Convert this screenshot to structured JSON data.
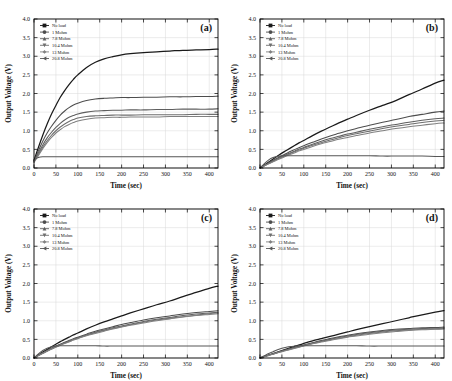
{
  "figure": {
    "background": "#ffffff",
    "panel_count": 4
  },
  "axes": {
    "xlabel": "Time (sec)",
    "ylabel": "Output Voltage (V)",
    "xlim": [
      0,
      420
    ],
    "ylim": [
      0.0,
      4.0
    ],
    "xticks": [
      0,
      50,
      100,
      150,
      200,
      250,
      300,
      350,
      400
    ],
    "xtick_labels": [
      "0",
      "50",
      "100",
      "150",
      "200",
      "250",
      "300",
      "350",
      "400"
    ],
    "yticks": [
      0.0,
      0.5,
      1.0,
      1.5,
      2.0,
      2.5,
      3.0,
      3.5,
      4.0
    ],
    "ytick_labels": [
      "0.0",
      "0.5",
      "1.0",
      "1.5",
      "2.0",
      "2.5",
      "3.0",
      "3.5",
      "4.0"
    ],
    "grid": true
  },
  "series_meta": [
    {
      "label": "No load",
      "marker": "square",
      "color": "#1a1a1a"
    },
    {
      "label": "1 Mohm",
      "marker": "circle",
      "color": "#4d4d4d"
    },
    {
      "label": "7.8 Mohm",
      "marker": "triangle-up",
      "color": "#5e5e5e"
    },
    {
      "label": "10.4 Mohm",
      "marker": "triangle-down",
      "color": "#6e6e6e"
    },
    {
      "label": "13 Mohm",
      "marker": "diamond",
      "color": "#808080"
    },
    {
      "label": "20.8 Mohm",
      "marker": "triangle-left",
      "color": "#565656"
    }
  ],
  "chart_data": [
    {
      "type": "line",
      "panel": "(a)",
      "title": "",
      "xlabel": "Time (sec)",
      "ylabel": "Output Voltage (V)",
      "xlim": [
        0,
        420
      ],
      "ylim": [
        0.0,
        4.0
      ],
      "grid": true,
      "legend_position": "upper-left",
      "x": [
        0,
        10,
        20,
        30,
        40,
        50,
        60,
        70,
        80,
        90,
        100,
        120,
        140,
        160,
        180,
        200,
        220,
        250,
        280,
        310,
        340,
        370,
        400,
        420
      ],
      "series": [
        {
          "name": "No load",
          "values": [
            0.2,
            0.55,
            0.88,
            1.18,
            1.45,
            1.68,
            1.9,
            2.08,
            2.24,
            2.38,
            2.5,
            2.7,
            2.84,
            2.93,
            2.99,
            3.04,
            3.07,
            3.1,
            3.12,
            3.14,
            3.16,
            3.17,
            3.18,
            3.19
          ]
        },
        {
          "name": "1 Mohm",
          "values": [
            0.18,
            0.46,
            0.72,
            0.94,
            1.12,
            1.28,
            1.42,
            1.53,
            1.62,
            1.69,
            1.74,
            1.81,
            1.85,
            1.87,
            1.88,
            1.89,
            1.89,
            1.9,
            1.9,
            1.91,
            1.91,
            1.92,
            1.92,
            1.93
          ]
        },
        {
          "name": "7.8 Mohm",
          "values": [
            0.17,
            0.4,
            0.62,
            0.81,
            0.96,
            1.09,
            1.2,
            1.29,
            1.36,
            1.41,
            1.45,
            1.5,
            1.53,
            1.54,
            1.55,
            1.55,
            1.56,
            1.56,
            1.57,
            1.57,
            1.58,
            1.58,
            1.58,
            1.59
          ]
        },
        {
          "name": "10.4 Mohm",
          "values": [
            0.16,
            0.36,
            0.56,
            0.73,
            0.88,
            1.0,
            1.1,
            1.18,
            1.25,
            1.3,
            1.34,
            1.38,
            1.4,
            1.41,
            1.42,
            1.42,
            1.42,
            1.43,
            1.43,
            1.43,
            1.43,
            1.44,
            1.44,
            1.44
          ]
        },
        {
          "name": "13 Mohm",
          "values": [
            0.15,
            0.33,
            0.52,
            0.68,
            0.82,
            0.94,
            1.03,
            1.11,
            1.17,
            1.22,
            1.26,
            1.31,
            1.34,
            1.35,
            1.36,
            1.36,
            1.37,
            1.37,
            1.37,
            1.38,
            1.38,
            1.38,
            1.38,
            1.38
          ]
        },
        {
          "name": "20.8 Mohm",
          "values": [
            0.22,
            0.28,
            0.3,
            0.3,
            0.3,
            0.3,
            0.3,
            0.3,
            0.3,
            0.3,
            0.3,
            0.3,
            0.3,
            0.3,
            0.3,
            0.3,
            0.3,
            0.3,
            0.3,
            0.3,
            0.3,
            0.3,
            0.3,
            0.3
          ]
        }
      ]
    },
    {
      "type": "line",
      "panel": "(b)",
      "title": "",
      "xlabel": "Time (sec)",
      "ylabel": "Output Voltage (V)",
      "xlim": [
        0,
        420
      ],
      "ylim": [
        0.0,
        4.0
      ],
      "grid": true,
      "legend_position": "upper-left",
      "x": [
        0,
        10,
        20,
        30,
        40,
        50,
        60,
        70,
        80,
        90,
        100,
        120,
        140,
        160,
        180,
        200,
        220,
        250,
        280,
        310,
        340,
        370,
        400,
        420
      ],
      "series": [
        {
          "name": "No load",
          "values": [
            0.0,
            0.08,
            0.16,
            0.24,
            0.32,
            0.4,
            0.47,
            0.54,
            0.61,
            0.68,
            0.74,
            0.87,
            0.99,
            1.1,
            1.21,
            1.31,
            1.41,
            1.55,
            1.68,
            1.81,
            1.97,
            2.12,
            2.28,
            2.36
          ]
        },
        {
          "name": "1 Mohm",
          "values": [
            0.0,
            0.07,
            0.14,
            0.21,
            0.27,
            0.33,
            0.39,
            0.45,
            0.5,
            0.55,
            0.6,
            0.69,
            0.78,
            0.86,
            0.93,
            1.0,
            1.06,
            1.15,
            1.23,
            1.3,
            1.38,
            1.44,
            1.5,
            1.53
          ]
        },
        {
          "name": "7.8 Mohm",
          "values": [
            0.0,
            0.06,
            0.13,
            0.19,
            0.25,
            0.31,
            0.36,
            0.41,
            0.46,
            0.51,
            0.55,
            0.64,
            0.72,
            0.79,
            0.85,
            0.91,
            0.96,
            1.04,
            1.11,
            1.17,
            1.23,
            1.28,
            1.32,
            1.34
          ]
        },
        {
          "name": "10.4 Mohm",
          "values": [
            0.0,
            0.06,
            0.12,
            0.18,
            0.24,
            0.29,
            0.34,
            0.39,
            0.44,
            0.48,
            0.53,
            0.61,
            0.68,
            0.75,
            0.81,
            0.87,
            0.92,
            0.99,
            1.06,
            1.12,
            1.17,
            1.22,
            1.26,
            1.28
          ]
        },
        {
          "name": "13 Mohm",
          "values": [
            0.0,
            0.06,
            0.11,
            0.17,
            0.22,
            0.27,
            0.32,
            0.37,
            0.41,
            0.46,
            0.5,
            0.58,
            0.65,
            0.71,
            0.77,
            0.82,
            0.87,
            0.94,
            1.0,
            1.06,
            1.11,
            1.15,
            1.19,
            1.21
          ]
        },
        {
          "name": "20.8 Mohm",
          "values": [
            0.0,
            0.12,
            0.22,
            0.28,
            0.31,
            0.33,
            0.33,
            0.33,
            0.33,
            0.33,
            0.33,
            0.33,
            0.33,
            0.33,
            0.33,
            0.33,
            0.33,
            0.33,
            0.32,
            0.32,
            0.32,
            0.32,
            0.31,
            0.31
          ]
        }
      ]
    },
    {
      "type": "line",
      "panel": "(c)",
      "title": "",
      "xlabel": "Time (sec)",
      "ylabel": "Output Voltage (V)",
      "xlim": [
        0,
        420
      ],
      "ylim": [
        0.0,
        4.0
      ],
      "grid": true,
      "legend_position": "upper-left",
      "x": [
        0,
        10,
        20,
        30,
        40,
        50,
        60,
        70,
        80,
        90,
        100,
        120,
        140,
        160,
        180,
        200,
        220,
        250,
        280,
        310,
        340,
        370,
        400,
        420
      ],
      "series": [
        {
          "name": "No load",
          "values": [
            0.0,
            0.08,
            0.16,
            0.23,
            0.3,
            0.37,
            0.44,
            0.5,
            0.56,
            0.62,
            0.67,
            0.78,
            0.88,
            0.97,
            1.05,
            1.13,
            1.21,
            1.32,
            1.43,
            1.53,
            1.65,
            1.76,
            1.87,
            1.93
          ]
        },
        {
          "name": "1 Mohm",
          "values": [
            0.0,
            0.07,
            0.14,
            0.2,
            0.26,
            0.32,
            0.37,
            0.42,
            0.47,
            0.52,
            0.56,
            0.64,
            0.72,
            0.78,
            0.84,
            0.9,
            0.95,
            1.02,
            1.08,
            1.13,
            1.18,
            1.22,
            1.25,
            1.27
          ]
        },
        {
          "name": "7.8 Mohm",
          "values": [
            0.0,
            0.07,
            0.13,
            0.19,
            0.25,
            0.31,
            0.36,
            0.41,
            0.45,
            0.5,
            0.54,
            0.62,
            0.69,
            0.75,
            0.81,
            0.86,
            0.91,
            0.98,
            1.04,
            1.09,
            1.14,
            1.18,
            1.21,
            1.23
          ]
        },
        {
          "name": "10.4 Mohm",
          "values": [
            0.0,
            0.07,
            0.13,
            0.19,
            0.24,
            0.3,
            0.35,
            0.4,
            0.44,
            0.49,
            0.53,
            0.61,
            0.68,
            0.74,
            0.79,
            0.84,
            0.89,
            0.96,
            1.02,
            1.07,
            1.11,
            1.15,
            1.19,
            1.21
          ]
        },
        {
          "name": "13 Mohm",
          "values": [
            0.0,
            0.06,
            0.12,
            0.18,
            0.24,
            0.29,
            0.34,
            0.39,
            0.43,
            0.48,
            0.52,
            0.6,
            0.66,
            0.72,
            0.78,
            0.83,
            0.88,
            0.94,
            1.0,
            1.05,
            1.1,
            1.14,
            1.17,
            1.19
          ]
        },
        {
          "name": "20.8 Mohm",
          "values": [
            0.0,
            0.11,
            0.2,
            0.26,
            0.3,
            0.32,
            0.33,
            0.33,
            0.33,
            0.33,
            0.33,
            0.33,
            0.33,
            0.32,
            0.32,
            0.32,
            0.32,
            0.32,
            0.32,
            0.32,
            0.32,
            0.32,
            0.32,
            0.32
          ]
        }
      ]
    },
    {
      "type": "line",
      "panel": "(d)",
      "title": "",
      "xlabel": "Time (sec)",
      "ylabel": "Output Voltage (V)",
      "xlim": [
        0,
        420
      ],
      "ylim": [
        0.0,
        4.0
      ],
      "grid": true,
      "legend_position": "upper-left",
      "x": [
        0,
        10,
        20,
        30,
        40,
        50,
        60,
        70,
        80,
        90,
        100,
        120,
        140,
        160,
        180,
        200,
        220,
        250,
        280,
        310,
        340,
        370,
        400,
        420
      ],
      "series": [
        {
          "name": "No load",
          "values": [
            0.0,
            0.04,
            0.08,
            0.12,
            0.16,
            0.2,
            0.24,
            0.28,
            0.32,
            0.35,
            0.39,
            0.46,
            0.52,
            0.58,
            0.64,
            0.7,
            0.76,
            0.84,
            0.92,
            1.0,
            1.08,
            1.16,
            1.23,
            1.27
          ]
        },
        {
          "name": "1 Mohm",
          "values": [
            0.0,
            0.04,
            0.08,
            0.11,
            0.15,
            0.19,
            0.22,
            0.26,
            0.29,
            0.32,
            0.35,
            0.41,
            0.47,
            0.52,
            0.57,
            0.61,
            0.65,
            0.7,
            0.74,
            0.77,
            0.79,
            0.81,
            0.82,
            0.83
          ]
        },
        {
          "name": "7.8 Mohm",
          "values": [
            0.0,
            0.04,
            0.08,
            0.11,
            0.15,
            0.18,
            0.22,
            0.25,
            0.28,
            0.31,
            0.34,
            0.4,
            0.45,
            0.5,
            0.55,
            0.59,
            0.63,
            0.68,
            0.72,
            0.75,
            0.77,
            0.79,
            0.8,
            0.81
          ]
        },
        {
          "name": "10.4 Mohm",
          "values": [
            0.0,
            0.04,
            0.07,
            0.11,
            0.14,
            0.18,
            0.21,
            0.24,
            0.27,
            0.3,
            0.33,
            0.39,
            0.44,
            0.49,
            0.53,
            0.57,
            0.61,
            0.66,
            0.7,
            0.73,
            0.75,
            0.77,
            0.78,
            0.79
          ]
        },
        {
          "name": "13 Mohm",
          "values": [
            0.0,
            0.04,
            0.07,
            0.1,
            0.14,
            0.17,
            0.2,
            0.23,
            0.26,
            0.29,
            0.32,
            0.38,
            0.43,
            0.47,
            0.52,
            0.56,
            0.59,
            0.64,
            0.68,
            0.71,
            0.74,
            0.76,
            0.77,
            0.78
          ]
        },
        {
          "name": "20.8 Mohm",
          "values": [
            0.0,
            0.06,
            0.12,
            0.17,
            0.22,
            0.26,
            0.29,
            0.31,
            0.32,
            0.33,
            0.33,
            0.33,
            0.33,
            0.33,
            0.33,
            0.33,
            0.33,
            0.32,
            0.32,
            0.32,
            0.32,
            0.32,
            0.32,
            0.32
          ]
        }
      ]
    }
  ]
}
